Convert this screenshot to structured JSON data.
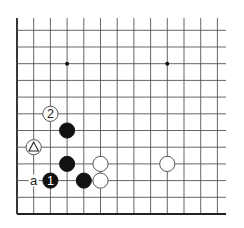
{
  "diagram": {
    "type": "go-board-fragment",
    "columns": 13,
    "rows": 12,
    "edges": [
      "left",
      "bottom"
    ],
    "colors": {
      "black": "#111111",
      "white": "#ffffff",
      "line": "#555555"
    },
    "star_points": [
      {
        "col": 3,
        "row": 9
      },
      {
        "col": 9,
        "row": 9
      }
    ],
    "stones": [
      {
        "color": "black",
        "col": 3,
        "row": 5,
        "label": ""
      },
      {
        "color": "black",
        "col": 3,
        "row": 3,
        "label": ""
      },
      {
        "color": "black",
        "col": 2,
        "row": 2,
        "label": "1"
      },
      {
        "color": "black",
        "col": 4,
        "row": 2,
        "label": ""
      },
      {
        "color": "white",
        "col": 5,
        "row": 3,
        "label": ""
      },
      {
        "color": "white",
        "col": 5,
        "row": 2,
        "label": ""
      },
      {
        "color": "white",
        "col": 9,
        "row": 3,
        "label": ""
      },
      {
        "color": "white",
        "col": 2,
        "row": 6,
        "label": "2"
      },
      {
        "color": "white",
        "col": 1,
        "row": 4,
        "label": "",
        "marker": "triangle"
      }
    ],
    "point_labels": [
      {
        "col": 1,
        "row": 2,
        "text": "a"
      }
    ]
  }
}
